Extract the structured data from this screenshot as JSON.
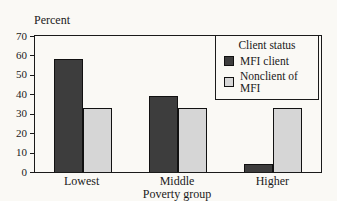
{
  "chart_data": {
    "type": "bar",
    "title": "",
    "ylabel": "Percent",
    "xlabel": "Poverty group",
    "categories": [
      "Lowest",
      "Middle",
      "Higher"
    ],
    "series": [
      {
        "name": "MFI client",
        "color": "#3d3d3d",
        "values": [
          58,
          39,
          4
        ]
      },
      {
        "name": "Nonclient of MFI",
        "color": "#d6d6d6",
        "values": [
          33,
          33,
          33
        ]
      }
    ],
    "ylim": [
      0,
      70
    ],
    "yticks": [
      0,
      10,
      20,
      30,
      40,
      50,
      60,
      70
    ],
    "legend_title": "Client status",
    "legend_position": "top-right",
    "grid": false
  }
}
